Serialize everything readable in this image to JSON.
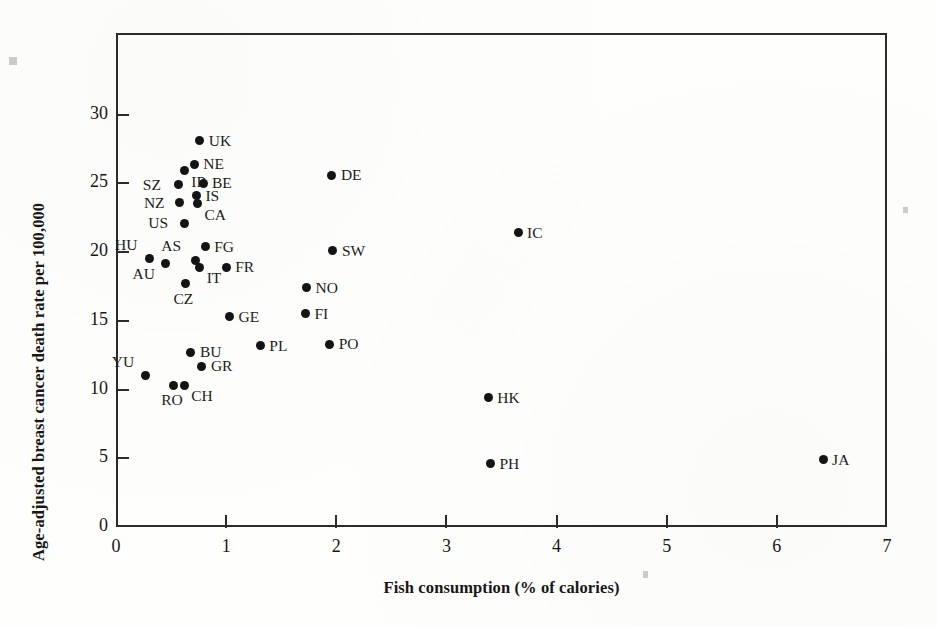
{
  "figure": {
    "x_axis_title": "Fish consumption (% of calories)",
    "y_axis_title": "Age-adjusted breast cancer death rate per 100,000",
    "x_ticks": [
      "0",
      "1",
      "2",
      "3",
      "4",
      "5",
      "6",
      "7"
    ],
    "y_ticks": [
      "0",
      "5",
      "10",
      "15",
      "20",
      "25",
      "30"
    ],
    "point_color": "#141414",
    "axis_color": "#2b2b2b"
  },
  "chart_data": {
    "type": "scatter",
    "title": "",
    "xlabel": "Fish consumption (% of calories)",
    "ylabel": "Age-adjusted breast cancer death rate per 100,000",
    "xlim": [
      0,
      7
    ],
    "ylim": [
      0,
      34
    ],
    "xticks": [
      0,
      1,
      2,
      3,
      4,
      5,
      6,
      7
    ],
    "yticks": [
      0,
      5,
      10,
      15,
      20,
      25,
      30
    ],
    "grid": false,
    "legend": "none",
    "point_labels_shown": true,
    "points": [
      {
        "label": "UK",
        "x": 0.76,
        "y": 28.1,
        "label_pos": "right"
      },
      {
        "label": "NE",
        "x": 0.71,
        "y": 26.4,
        "label_pos": "right"
      },
      {
        "label": "IR",
        "x": 0.62,
        "y": 25.9,
        "label_pos": "below-right"
      },
      {
        "label": "BE",
        "x": 0.79,
        "y": 25.0,
        "label_pos": "right"
      },
      {
        "label": "SZ",
        "x": 0.57,
        "y": 24.9,
        "label_pos": "left"
      },
      {
        "label": "IS",
        "x": 0.73,
        "y": 24.1,
        "label_pos": "right"
      },
      {
        "label": "CA",
        "x": 0.74,
        "y": 23.5,
        "label_pos": "below-right"
      },
      {
        "label": "NZ",
        "x": 0.58,
        "y": 23.6,
        "label_pos": "left"
      },
      {
        "label": "US",
        "x": 0.62,
        "y": 22.1,
        "label_pos": "left"
      },
      {
        "label": "FG",
        "x": 0.81,
        "y": 20.4,
        "label_pos": "right"
      },
      {
        "label": "AS",
        "x": 0.72,
        "y": 19.4,
        "label_pos": "above-left"
      },
      {
        "label": "HU",
        "x": 0.3,
        "y": 19.5,
        "label_pos": "above-left"
      },
      {
        "label": "AU",
        "x": 0.45,
        "y": 19.2,
        "label_pos": "below-left"
      },
      {
        "label": "IT",
        "x": 0.76,
        "y": 18.9,
        "label_pos": "below-right"
      },
      {
        "label": "FR",
        "x": 1.0,
        "y": 18.9,
        "label_pos": "right"
      },
      {
        "label": "CZ",
        "x": 0.63,
        "y": 17.7,
        "label_pos": "below"
      },
      {
        "label": "GE",
        "x": 1.03,
        "y": 15.3,
        "label_pos": "right"
      },
      {
        "label": "BU",
        "x": 0.68,
        "y": 12.7,
        "label_pos": "right"
      },
      {
        "label": "GR",
        "x": 0.78,
        "y": 11.7,
        "label_pos": "right"
      },
      {
        "label": "YU",
        "x": 0.27,
        "y": 11.0,
        "label_pos": "above-left"
      },
      {
        "label": "RO",
        "x": 0.52,
        "y": 10.3,
        "label_pos": "below"
      },
      {
        "label": "CH",
        "x": 0.62,
        "y": 10.3,
        "label_pos": "below-right"
      },
      {
        "label": "PL",
        "x": 1.31,
        "y": 13.2,
        "label_pos": "right"
      },
      {
        "label": "PO",
        "x": 1.94,
        "y": 13.3,
        "label_pos": "right"
      },
      {
        "label": "FI",
        "x": 1.72,
        "y": 15.5,
        "label_pos": "right"
      },
      {
        "label": "NO",
        "x": 1.73,
        "y": 17.4,
        "label_pos": "right"
      },
      {
        "label": "SW",
        "x": 1.97,
        "y": 20.1,
        "label_pos": "right"
      },
      {
        "label": "DE",
        "x": 1.96,
        "y": 25.6,
        "label_pos": "right"
      },
      {
        "label": "IC",
        "x": 3.65,
        "y": 21.4,
        "label_pos": "right"
      },
      {
        "label": "HK",
        "x": 3.38,
        "y": 9.4,
        "label_pos": "right"
      },
      {
        "label": "PH",
        "x": 3.4,
        "y": 4.6,
        "label_pos": "right"
      },
      {
        "label": "JA",
        "x": 6.42,
        "y": 4.9,
        "label_pos": "right"
      }
    ]
  }
}
